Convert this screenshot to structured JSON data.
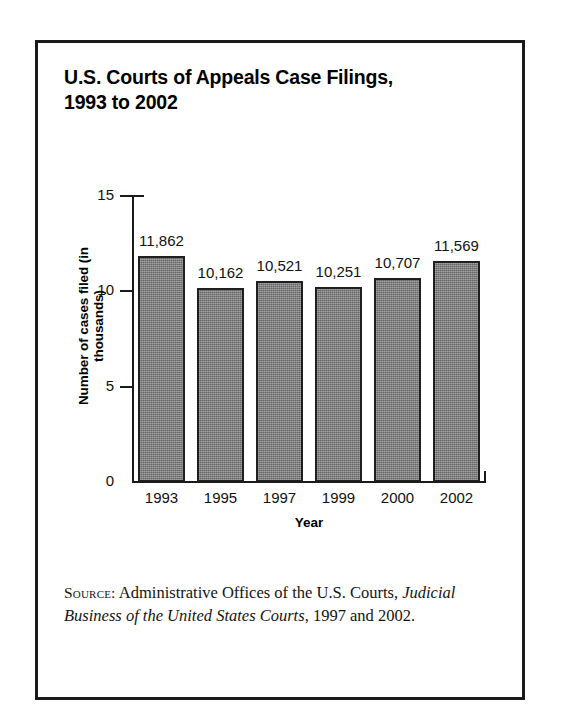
{
  "figure": {
    "title": "U.S. Courts of Appeals Case Filings,\n1993 to 2002",
    "source_label": "Source:",
    "source_text_before": " Administrative Offices of the U.S. Courts, ",
    "source_italic": "Judicial Business of the United States Courts",
    "source_text_after": ", 1997 and 2002."
  },
  "chart_data": {
    "type": "bar",
    "title": "U.S. Courts of Appeals Case Filings, 1993 to 2002",
    "categories": [
      "1993",
      "1995",
      "1997",
      "1999",
      "2000",
      "2002"
    ],
    "values": [
      11862,
      10162,
      10521,
      10251,
      10707,
      11569
    ],
    "value_labels": [
      "11,862",
      "10,162",
      "10,521",
      "10,251",
      "10,707",
      "11,569"
    ],
    "plotted_values_thousands": [
      11.862,
      10.162,
      10.521,
      10.251,
      10.707,
      11.569
    ],
    "xlabel": "Year",
    "ylabel": "Number of cases filed (in thousands)",
    "ylim": [
      0,
      15
    ],
    "yticks": [
      0,
      5,
      10,
      15
    ],
    "ytick_labels": [
      "0",
      "5",
      "10",
      "15"
    ],
    "grid": false,
    "legend": false,
    "bar_color": "#7e7e7e",
    "bar_edge_color": "#1f1f1f",
    "axis_color": "#1a1a1a",
    "units": "thousands of cases filed"
  }
}
